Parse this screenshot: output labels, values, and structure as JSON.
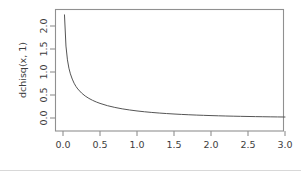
{
  "chart_data": {
    "type": "line",
    "title": "",
    "subtitle": "",
    "xlabel": "",
    "ylabel": "dchisq(x, 1)",
    "xlim": [
      0,
      3
    ],
    "ylim": [
      0,
      2.25
    ],
    "grid": false,
    "legend": null,
    "legend_position": "none",
    "annotations": [],
    "xticks": [
      "0.0",
      "0.5",
      "1.0",
      "1.5",
      "2.0",
      "2.5",
      "3.0"
    ],
    "xtick_values": [
      0.0,
      0.5,
      1.0,
      1.5,
      2.0,
      2.5,
      3.0
    ],
    "yticks": [
      "0.0",
      "0.5",
      "1.0",
      "1.5",
      "2.0"
    ],
    "ytick_values": [
      0.0,
      0.5,
      1.0,
      1.5,
      2.0
    ],
    "series": [
      {
        "name": "dchisq(x, 1)",
        "color": "#555555",
        "x": [
          0.02,
          0.04,
          0.06,
          0.08,
          0.1,
          0.125,
          0.15,
          0.175,
          0.2,
          0.25,
          0.3,
          0.35,
          0.4,
          0.45,
          0.5,
          0.6,
          0.7,
          0.8,
          0.9,
          1.0,
          1.1,
          1.2,
          1.3,
          1.4,
          1.5,
          1.6,
          1.7,
          1.8,
          1.9,
          2.0,
          2.1,
          2.2,
          2.3,
          2.4,
          2.5,
          2.6,
          2.7,
          2.8,
          2.9,
          3.0
        ],
        "y": [
          2.242,
          1.564,
          1.264,
          1.083,
          0.9598,
          0.8459,
          0.7562,
          0.6868,
          0.6311,
          0.5441,
          0.4782,
          0.4262,
          0.3836,
          0.348,
          0.3176,
          0.2683,
          0.23,
          0.1994,
          0.1743,
          0.1534,
          0.1358,
          0.1207,
          0.1078,
          0.0965,
          0.0867,
          0.0781,
          0.0705,
          0.0638,
          0.0578,
          0.0525,
          0.0477,
          0.0435,
          0.0396,
          0.0362,
          0.0331,
          0.0303,
          0.0277,
          0.0254,
          0.0233,
          0.0214
        ]
      }
    ]
  },
  "figure": {
    "frame_color": "#909090",
    "axis_text_color": "#3d3d3d",
    "curve_color": "#555555",
    "background": "#ffffff"
  }
}
